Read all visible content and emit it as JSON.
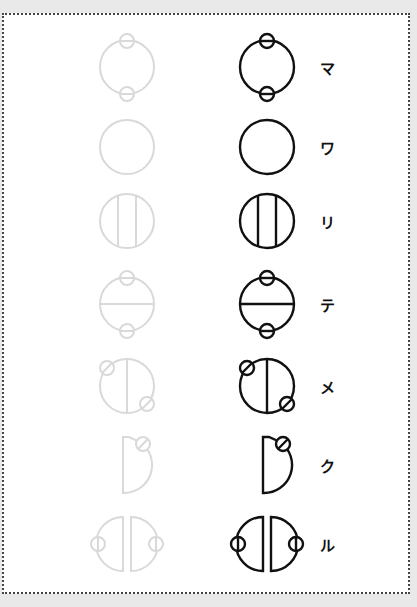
{
  "rows": [
    {
      "kana": "マ",
      "shape": "circle-top-bottom-nodes",
      "y": 67
    },
    {
      "kana": "ワ",
      "shape": "plain-circle",
      "y": 147
    },
    {
      "kana": "リ",
      "shape": "circle-two-vertical-lines",
      "y": 221
    },
    {
      "kana": "テ",
      "shape": "circle-horizontal-line-top-bottom-nodes",
      "y": 304
    },
    {
      "kana": "メ",
      "shape": "circle-vertical-line-diagonal-nodes",
      "y": 386
    },
    {
      "kana": "ク",
      "shape": "half-circle-top-node",
      "y": 465
    },
    {
      "kana": "ル",
      "shape": "split-halves-side-nodes",
      "y": 544
    }
  ],
  "colors": {
    "ghost_stroke": "#d9d9d9",
    "main_stroke": "#111111",
    "page_background": "#e9e9e9",
    "sheet_background": "#ffffff"
  },
  "columns": {
    "ghost_x": 127,
    "main_x": 267,
    "kana_x": 327
  }
}
